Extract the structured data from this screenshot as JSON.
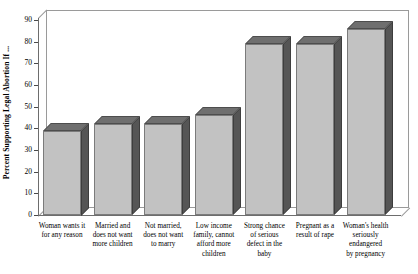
{
  "chart_data": {
    "type": "bar",
    "title": "",
    "subtitle": "",
    "xlabel": "",
    "ylabel": "Percent Supporting Legal Abortion If ...",
    "ylim": [
      0,
      90
    ],
    "ytick_step": 10,
    "yticks": [
      "0",
      "10",
      "20",
      "30",
      "40",
      "50",
      "60",
      "70",
      "80",
      "90"
    ],
    "grid": false,
    "legend": "none",
    "style": "3d-bar",
    "categories": [
      "Woman wants it for any reason",
      "Married and does not want more children",
      "Not married, does not want to marry",
      "Low income family, cannot afford more children",
      "Strong chance of serious defect in the baby",
      "Pregnant as a result of rape",
      "Woman's health seriously endangered by pregnancy"
    ],
    "category_lines": [
      [
        "Woman wants it",
        "for any reason"
      ],
      [
        "Married and",
        "does not want",
        "more children"
      ],
      [
        "Not married,",
        "does not want",
        "to marry"
      ],
      [
        "Low income",
        "family, cannot",
        "afford more",
        "children"
      ],
      [
        "Strong chance",
        "of serious",
        "defect in the",
        "baby"
      ],
      [
        "Pregnant as a",
        "result of rape"
      ],
      [
        "Woman's health",
        "seriously endangered",
        "by pregnancy"
      ]
    ],
    "values": [
      39,
      42,
      42,
      46,
      79,
      79,
      86
    ],
    "colors": {
      "bar_front": "#c2c2c2",
      "bar_top": "#6f6f6f",
      "bar_side": "#555555",
      "axis": "#6d6d6d",
      "frame": "#9a9a9a",
      "text": "#000000",
      "background": "#ffffff"
    }
  }
}
